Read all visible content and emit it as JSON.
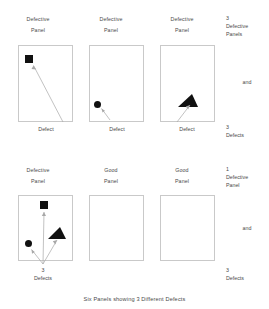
{
  "figure": {
    "caption": "Six Panels showing 3 Different Defects",
    "defect_caption_single": "Defect",
    "defect_caption_multi_count": "3",
    "defect_caption_multi_word": "Defects",
    "labels": {
      "defective": "Defective",
      "good": "Good",
      "panel_word": "Panel",
      "panels_word": "Panels",
      "defects_word": "Defects",
      "and": "and"
    },
    "rows": [
      {
        "row_id": "row-1",
        "panels": [
          {
            "title_line1": "Defective",
            "title_line2": "Panel",
            "state": "defective",
            "defect_shape": "square",
            "caption_line1": "Defect",
            "caption_line2": ""
          },
          {
            "title_line1": "Defective",
            "title_line2": "Panel",
            "state": "defective",
            "defect_shape": "circle",
            "caption_line1": "Defect",
            "caption_line2": ""
          },
          {
            "title_line1": "Defective",
            "title_line2": "Panel",
            "state": "defective",
            "defect_shape": "triangle",
            "caption_line1": "Defect",
            "caption_line2": ""
          }
        ],
        "summary": {
          "count_top": "3",
          "top_line1": "Defective",
          "top_line2": "Panels",
          "conjunction": "and",
          "count_bottom": "3",
          "bottom_line1": "Defects"
        }
      },
      {
        "row_id": "row-2",
        "panels": [
          {
            "title_line1": "Defective",
            "title_line2": "Panel",
            "state": "defective",
            "defect_shape": "square+circle+triangle",
            "caption_line1": "3",
            "caption_line2": "Defects"
          },
          {
            "title_line1": "Good",
            "title_line2": "Panel",
            "state": "good",
            "defect_shape": "none",
            "caption_line1": "",
            "caption_line2": ""
          },
          {
            "title_line1": "Good",
            "title_line2": "Panel",
            "state": "good",
            "defect_shape": "none",
            "caption_line1": "",
            "caption_line2": ""
          }
        ],
        "summary": {
          "count_top": "1",
          "top_line1": "Defective",
          "top_line2": "Panel",
          "conjunction": "and",
          "count_bottom": "3",
          "bottom_line1": "Defects"
        }
      }
    ],
    "colors": {
      "defect_fill": "#111111",
      "panel_border": "#c9c9c9",
      "arrow_stroke": "#a8a8a8",
      "text": "#4a4a4a",
      "background": "#ffffff"
    }
  }
}
